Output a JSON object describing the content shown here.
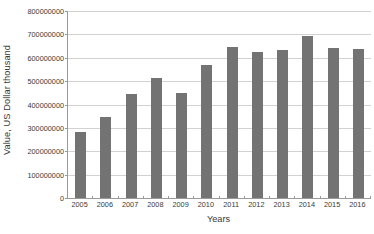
{
  "chart_data": {
    "type": "bar",
    "title": "",
    "xlabel": "Years",
    "ylabel": "Value, US Dollar thousand",
    "categories": [
      "2005",
      "2006",
      "2007",
      "2008",
      "2009",
      "2010",
      "2011",
      "2012",
      "2013",
      "2014",
      "2015",
      "2016"
    ],
    "values": [
      282000000,
      347000000,
      445000000,
      513000000,
      449000000,
      569000000,
      648000000,
      623000000,
      633000000,
      693000000,
      642000000,
      638000000
    ],
    "series": [
      {
        "name": "Value",
        "values": [
          282000000,
          347000000,
          445000000,
          513000000,
          449000000,
          569000000,
          648000000,
          623000000,
          633000000,
          693000000,
          642000000,
          638000000
        ]
      }
    ],
    "ylim": [
      0,
      800000000
    ],
    "ytick_values": [
      0,
      100000000,
      200000000,
      300000000,
      400000000,
      500000000,
      600000000,
      700000000,
      800000000
    ],
    "ytick_labels": [
      "0",
      "100000000",
      "200000000",
      "300000000",
      "400000000",
      "500000000",
      "600000000",
      "700000000",
      "800000000"
    ],
    "grid": true,
    "legend": false,
    "legend_position": "none",
    "bar_color": "#737373",
    "gridline_color": "#d2d2d2",
    "axis_color": "#9a9a9a"
  }
}
